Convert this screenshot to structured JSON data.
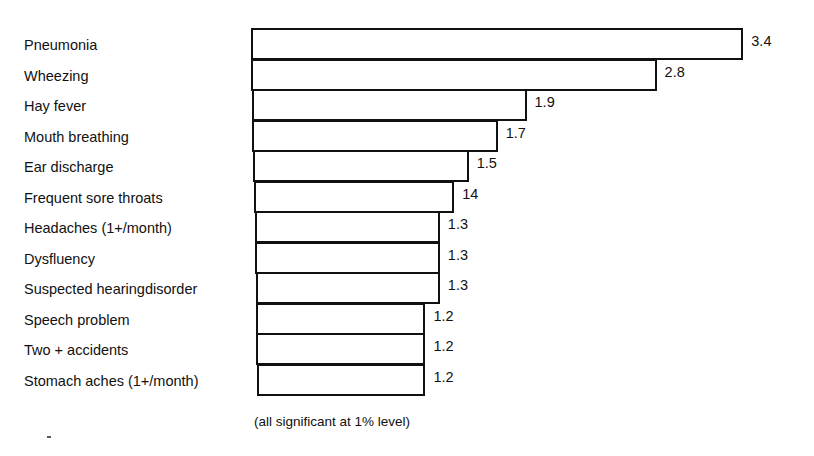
{
  "chart_data": {
    "type": "bar",
    "orientation": "horizontal",
    "title": "",
    "xlabel": "",
    "ylabel": "",
    "categories": [
      "Pneumonia",
      "Wheezing",
      "Hay fever",
      "Mouth breathing",
      "Ear discharge",
      "Frequent sore throats",
      "Headaches (1+/month)",
      "Dysfluency",
      "Suspected hearingdisorder",
      "Speech problem",
      "Two + accidents",
      "Stomach aches (1+/month)"
    ],
    "values": [
      3.4,
      2.8,
      1.9,
      1.7,
      1.5,
      1.4,
      1.3,
      1.3,
      1.3,
      1.2,
      1.2,
      1.2
    ],
    "value_labels": [
      "3.4",
      "2.8",
      "1.9",
      "1.7",
      "1.5",
      "14",
      "1.3",
      "1.3",
      "1.3",
      "1.2",
      "1.2",
      "1.2"
    ],
    "annotation": "(all significant at 1% level)",
    "grid": false,
    "legend": null,
    "bar_fill": "#ffffff",
    "bar_stroke": "#111111"
  },
  "footnote": "(all significant at 1% level)"
}
